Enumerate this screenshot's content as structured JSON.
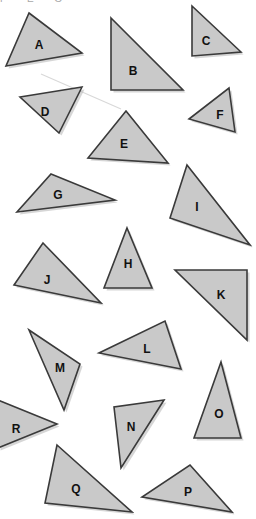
{
  "page": {
    "background_color": "#ffffff",
    "width": 256,
    "height": 519,
    "clipped_header_text": "F  E  G"
  },
  "style": {
    "fill_color": "#c9c9c9",
    "stroke_color": "#3a3a3a",
    "shadow_color": "#b4b4b4",
    "label_color": "#111111"
  },
  "shapes": [
    {
      "label": "A",
      "name": "triangle-a",
      "points": "29,13 82,53 6,66",
      "label_x": 39,
      "label_y": 46
    },
    {
      "label": "B",
      "name": "triangle-b",
      "points": "111,18 183,90 111,90",
      "label_x": 133,
      "label_y": 72
    },
    {
      "label": "C",
      "name": "triangle-c",
      "points": "192,6 241,52 192,56",
      "label_x": 206,
      "label_y": 42
    },
    {
      "label": "D",
      "name": "triangle-d",
      "points": "82,87 59,133 20,97",
      "label_x": 45,
      "label_y": 113
    },
    {
      "label": "E",
      "name": "triangle-e",
      "points": "126,111 168,163 88,158",
      "label_x": 124,
      "label_y": 145
    },
    {
      "label": "F",
      "name": "triangle-f",
      "points": "229,88 235,132 189,119",
      "label_x": 220,
      "label_y": 116
    },
    {
      "label": "G",
      "name": "triangle-g",
      "points": "51,174 115,200 17,212",
      "label_x": 58,
      "label_y": 196
    },
    {
      "label": "H",
      "name": "triangle-h",
      "points": "127,228 152,288 104,288",
      "label_x": 128,
      "label_y": 265
    },
    {
      "label": "I",
      "name": "triangle-i",
      "points": "187,165 250,245 170,218",
      "label_x": 197,
      "label_y": 208
    },
    {
      "label": "J",
      "name": "triangle-j",
      "points": "43,243 101,303 14,285",
      "label_x": 47,
      "label_y": 281
    },
    {
      "label": "K",
      "name": "triangle-k",
      "points": "175,270 247,270 247,340",
      "label_x": 221,
      "label_y": 296
    },
    {
      "label": "L",
      "name": "triangle-l",
      "points": "165,321 181,369 99,353",
      "label_x": 147,
      "label_y": 350
    },
    {
      "label": "M",
      "name": "triangle-m",
      "points": "29,330 80,364 64,410",
      "label_x": 60,
      "label_y": 369
    },
    {
      "label": "N",
      "name": "triangle-n",
      "points": "164,400 121,468 114,407",
      "label_x": 131,
      "label_y": 428
    },
    {
      "label": "O",
      "name": "triangle-o",
      "points": "221,362 241,438 194,438",
      "label_x": 219,
      "label_y": 415
    },
    {
      "label": "P",
      "name": "triangle-p",
      "points": "190,465 232,512 142,497",
      "label_x": 188,
      "label_y": 493
    },
    {
      "label": "Q",
      "name": "triangle-q",
      "points": "57,445 132,512 45,503",
      "label_x": 76,
      "label_y": 490
    },
    {
      "label": "R",
      "name": "triangle-r",
      "points": "-2,400 57,424 -2,448",
      "label_x": 16,
      "label_y": 430
    }
  ],
  "stray_marks": [
    {
      "name": "stray-line",
      "path": "M 41 74 L 121 109"
    }
  ]
}
